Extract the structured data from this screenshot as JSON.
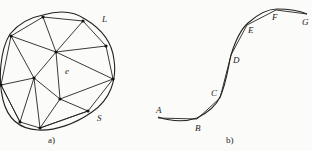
{
  "panel_a": {
    "caption": "a)",
    "labels": {
      "element": "e",
      "boundary_curve": "L",
      "boundary_polyline": "S"
    },
    "nodes": [
      {
        "id": "n1",
        "x": 43,
        "y": 17
      },
      {
        "id": "n2",
        "x": 83,
        "y": 21
      },
      {
        "id": "n3",
        "x": 106,
        "y": 46
      },
      {
        "id": "n4",
        "x": 113,
        "y": 79
      },
      {
        "id": "n5",
        "x": 88,
        "y": 111
      },
      {
        "id": "n6",
        "x": 40,
        "y": 128
      },
      {
        "id": "n7",
        "x": 20,
        "y": 122
      },
      {
        "id": "n8",
        "x": 1,
        "y": 85
      },
      {
        "id": "n9",
        "x": 11,
        "y": 36
      },
      {
        "id": "c1",
        "x": 56,
        "y": 52
      },
      {
        "id": "c2",
        "x": 34,
        "y": 78
      },
      {
        "id": "c3",
        "x": 60,
        "y": 99
      }
    ]
  },
  "panel_b": {
    "caption": "b)",
    "points": [
      {
        "label": "A",
        "x": 158,
        "y": 118
      },
      {
        "label": "B",
        "x": 197,
        "y": 119
      },
      {
        "label": "C",
        "x": 220,
        "y": 98
      },
      {
        "label": "D",
        "x": 231,
        "y": 55
      },
      {
        "label": "E",
        "x": 247,
        "y": 25
      },
      {
        "label": "F",
        "x": 276,
        "y": 10
      },
      {
        "label": "G",
        "x": 307,
        "y": 14
      }
    ]
  }
}
